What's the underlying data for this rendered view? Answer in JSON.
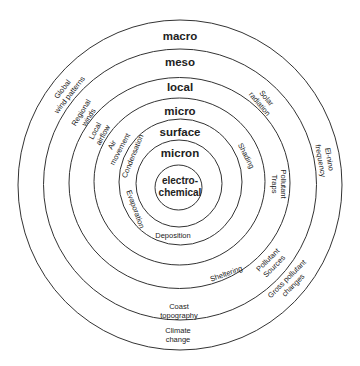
{
  "diagram": {
    "colors": {
      "ring": "#333333",
      "text": "#222222",
      "background": "#ffffff"
    },
    "center": {
      "line1": "electro-",
      "line2": "chemical"
    },
    "scales": [
      "macro",
      "meso",
      "local",
      "micro",
      "surface",
      "micron"
    ],
    "factors": {
      "global_wind": {
        "line1": "Global",
        "line2": "wind patterns"
      },
      "regional_winds": {
        "line1": "Regional",
        "line2": "winds"
      },
      "local_airflow": {
        "line1": "Local",
        "line2": "airflow"
      },
      "air_movement": {
        "line1": "Air",
        "line2": "movement"
      },
      "condensation": {
        "line1": "Condensation"
      },
      "evaporation": {
        "line1": "Evaporation"
      },
      "deposition": {
        "line1": "Deposition"
      },
      "solar_radiation": {
        "line1": "Solar",
        "line2": "radiation"
      },
      "shading": {
        "line1": "Shading"
      },
      "pollutant_traps": {
        "line1": "Pollutant",
        "line2": "Traps"
      },
      "el_nino": {
        "line1": "El-nino",
        "line2": "frequency"
      },
      "sheltering": {
        "line1": "Sheltering"
      },
      "pollutant_sources": {
        "line1": "Pollutant",
        "line2": "Sources"
      },
      "gross_pollutant": {
        "line1": "Gross pollutant",
        "line2": "changes"
      },
      "coast_topography": {
        "line1": "Coast",
        "line2": "topography"
      },
      "climate_change": {
        "line1": "Climate",
        "line2": "change"
      }
    }
  }
}
